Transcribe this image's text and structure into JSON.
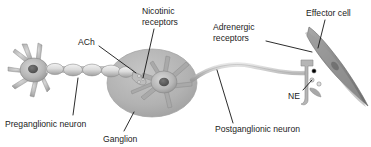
{
  "figure": {
    "background_color": "#ffffff",
    "width": 371,
    "height": 147
  },
  "labels": {
    "nicotinic_receptors_line1": "Nicotinic",
    "nicotinic_receptors_line2": "receptors",
    "ach": "ACh",
    "adrenergic_receptors_line1": "Adrenergic",
    "adrenergic_receptors_line2": "receptors",
    "effector_cell": "Effector cell",
    "ne": "NE",
    "preganglionic_neuron": "Preganglionic neuron",
    "ganglion": "Ganglion",
    "postganglionic_neuron": "Postganglionic neuron"
  },
  "colors": {
    "text": "#1b1b1b",
    "leader_line": "#141414",
    "ganglion_fill": "#b3b3b3",
    "ganglion_edge": "#9a9a9a",
    "neuron_body_fill": "#b8b8b8",
    "neuron_body_edge": "#8a8a8a",
    "nucleus_fill": "#5e5e5e",
    "myelin_fill": "#e4e4e4",
    "myelin_edge": "#8e8e8e",
    "axon_fill": "#cfcfcf",
    "effector_fill": "#8d8d8d",
    "effector_edge": "#6a6a6a",
    "vesicle_fill": "#d8d8d8",
    "background": "#ffffff"
  },
  "structures": [
    {
      "name": "preganglionic-neuron-soma",
      "description": "multipolar cell body at far left with radiating dendrites and dark nucleus"
    },
    {
      "name": "myelinated-axon",
      "description": "chain of four oval myelin segments running right from the preganglionic soma"
    },
    {
      "name": "ganglion",
      "description": "large gray oval enclosing the postganglionic neuron soma"
    },
    {
      "name": "postganglionic-neuron-soma",
      "description": "multipolar cell body inside the ganglion with dark nucleus"
    },
    {
      "name": "synaptic-terminal-ganglion",
      "description": "preganglionic axon terminal bouton with nicotinic receptors inside ganglion"
    },
    {
      "name": "postganglionic-axon",
      "description": "long unmyelinated wavy axon from ganglion to effector cell"
    },
    {
      "name": "varicosity-terminal",
      "description": "T-shaped nerve terminal with neurotransmitter vesicles releasing NE"
    },
    {
      "name": "effector-cell",
      "description": "dark elongated spindle-shaped smooth muscle effector cell, diagonal"
    }
  ]
}
